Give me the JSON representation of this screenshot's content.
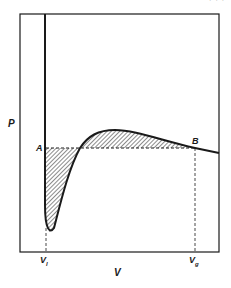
{
  "figure": {
    "type": "P-V isotherm with equal-area (Maxwell) construction",
    "corner_text": "· · ·",
    "axes": {
      "y_label": "P",
      "x_label": "V"
    },
    "points": {
      "A": "A",
      "B": "B"
    },
    "volume_marks": {
      "liquid": {
        "base": "V",
        "sub": "l"
      },
      "gas": {
        "base": "V",
        "sub": "g"
      }
    },
    "colors": {
      "ink": "#1a1a1a",
      "background": "#ffffff"
    }
  }
}
